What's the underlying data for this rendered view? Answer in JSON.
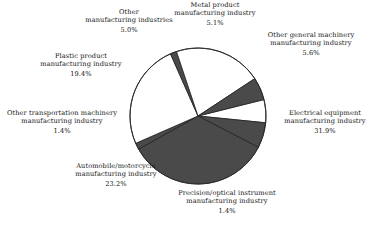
{
  "chart_data": {
    "type": "pie",
    "title": "",
    "subtitle": "",
    "xlabel": "",
    "ylabel": "",
    "legend_position": "none",
    "grid": false,
    "value_unit": "percent",
    "start_angle_deg": -14,
    "direction": "clockwise",
    "categories": [
      "Metal product manufacturing industry",
      "Other general machinery manufacturing industry",
      "Electrical equipment manufacturing industry",
      "Precision/optical instrument manufacturing industry",
      "Automobile/motorcycle manufacturing industry",
      "Other transportation machinery manufacturing industry",
      "Plastic product manufacturing industry",
      "Other manufacturing industries"
    ],
    "values": [
      5.1,
      5.6,
      31.9,
      1.4,
      23.2,
      1.4,
      19.4,
      5.0
    ],
    "value_labels": [
      "5.1%",
      "5.6%",
      "31.9%",
      "1.4%",
      "23.2%",
      "1.4%",
      "19.4%",
      "5.0%"
    ],
    "slice_colors": [
      "#ffffff",
      "#4a4a4a",
      "#4a4a4a",
      "#4a4a4a",
      "#ffffff",
      "#4a4a4a",
      "#ffffff",
      "#4a4a4a"
    ],
    "stroke_color": "#222222",
    "total": 93.0
  },
  "labels": {
    "other_manufacturing": {
      "name_line1": "Other",
      "name_line2": "manufacturing industries",
      "percent": "5.0%"
    },
    "metal_product": {
      "name_line1": "Metal product",
      "name_line2": "manufacturing industry",
      "percent": "5.1%"
    },
    "other_general_machinery": {
      "name_line1": "Other general machinery",
      "name_line2": "manufacturing industry",
      "percent": "5.6%"
    },
    "electrical_equipment": {
      "name_line1": "Electrical equipment",
      "name_line2": "manufacturing industry",
      "percent": "31.9%"
    },
    "precision_optical": {
      "name_line1": "Precision/optical instrument",
      "name_line2": "manufacturing industry",
      "percent": "1.4%"
    },
    "automobile_motorcycle": {
      "name_line1": "Automobile/motorcycle",
      "name_line2": "manufacturing industry",
      "percent": "23.2%"
    },
    "other_transportation": {
      "name_line1": "Other transportation machinery",
      "name_line2": "manufacturing industry",
      "percent": "1.4%"
    },
    "plastic_product": {
      "name_line1": "Plastic product",
      "name_line2": "manufacturing industry",
      "percent": "19.4%"
    }
  },
  "geometry": {
    "center_x": 198,
    "center_y": 116,
    "radius": 68
  }
}
